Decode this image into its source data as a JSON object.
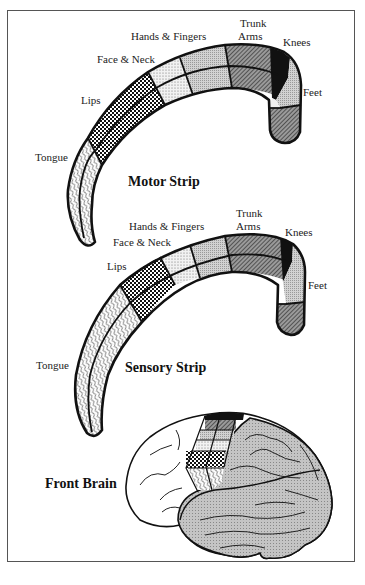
{
  "figure": {
    "motor_strip": {
      "title": "Motor Strip",
      "labels": {
        "tongue": "Tongue",
        "lips": "Lips",
        "face_neck": "Face & Neck",
        "hands_fingers": "Hands & Fingers",
        "trunk": "Trunk",
        "arms": "Arms",
        "knees": "Knees",
        "feet": "Feet"
      }
    },
    "sensory_strip": {
      "title": "Sensory Strip",
      "labels": {
        "tongue": "Tongue",
        "lips": "Lips",
        "face_neck": "Face & Neck",
        "hands_fingers": "Hands & Fingers",
        "trunk": "Trunk",
        "arms": "Arms",
        "knees": "Knees",
        "feet": "Feet"
      }
    },
    "brain": {
      "title": "Front Brain"
    },
    "patterns": {
      "tongue": "wavy-lines",
      "lips": "checker-crosshatch",
      "face_neck": "fine-dots",
      "hands_fingers": "light-stipple",
      "trunk_arms": "dark-diagonal-hatch",
      "knees": "solid-black",
      "feet": "light-stipple-and-dark-hatch",
      "brain_cortex": "gray-mesh"
    },
    "colors": {
      "ink": "#111111",
      "frame": "#555555",
      "brain_fill": "#b8b8b8"
    }
  }
}
